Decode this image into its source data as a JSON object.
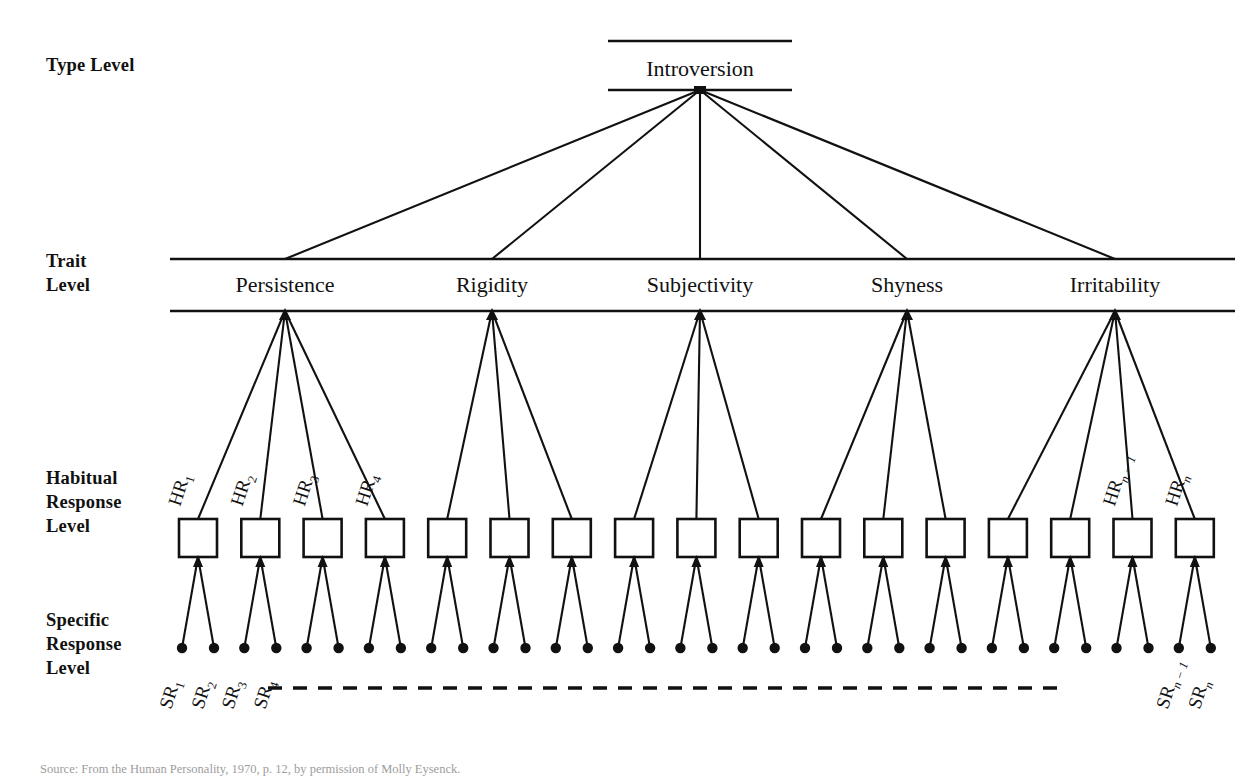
{
  "figure": {
    "source_caption": "Source: From the Human Personality, 1970, p. 12, by permission of Molly Eysenck."
  },
  "levels": [
    {
      "id": "type",
      "label": "Type Level"
    },
    {
      "id": "trait",
      "label": "Trait\nLevel"
    },
    {
      "id": "habitual",
      "label": "Habitual\nResponse\nLevel"
    },
    {
      "id": "specific",
      "label": "Specific\nResponse\nLevel"
    }
  ],
  "type_node": {
    "label": "Introversion",
    "x": 700,
    "y": 68,
    "band_left": 608,
    "band_right": 792,
    "band_top": 41,
    "band_bottom": 90
  },
  "trait_band": {
    "left": 170,
    "right": 1235,
    "top": 259,
    "bottom": 311,
    "text_y": 292
  },
  "traits": [
    {
      "label": "Persistence",
      "x": 285,
      "hr_count": 4
    },
    {
      "label": "Rigidity",
      "x": 492,
      "hr_count": 3
    },
    {
      "label": "Subjectivity",
      "x": 700,
      "hr_count": 3
    },
    {
      "label": "Shyness",
      "x": 907,
      "hr_count": 3
    },
    {
      "label": "Irritability",
      "x": 1115,
      "hr_count": 4
    }
  ],
  "hr_row": {
    "box_width": 38,
    "box_height": 38,
    "box_top": 519,
    "first_center_x": 198,
    "spacing": 62.3,
    "count": 17
  },
  "hr_labels": [
    {
      "index": 0,
      "base": "HR",
      "sub": "1",
      "sub_italic": false
    },
    {
      "index": 1,
      "base": "HR",
      "sub": "2",
      "sub_italic": false
    },
    {
      "index": 2,
      "base": "HR",
      "sub": "3",
      "sub_italic": false
    },
    {
      "index": 3,
      "base": "HR",
      "sub": "4",
      "sub_italic": false
    },
    {
      "index": 15,
      "base": "HR",
      "sub": "n − 1",
      "sub_italic": true
    },
    {
      "index": 16,
      "base": "HR",
      "sub": "n",
      "sub_italic": true
    }
  ],
  "sr_row": {
    "dot_radius": 5.2,
    "dot_y": 648,
    "leg_spread": 16,
    "per_box": 2
  },
  "sr_labels": [
    {
      "dot_index": 0,
      "base": "SR",
      "sub": "1",
      "sub_italic": false
    },
    {
      "dot_index": 1,
      "base": "SR",
      "sub": "2",
      "sub_italic": false
    },
    {
      "dot_index": 2,
      "base": "SR",
      "sub": "3",
      "sub_italic": false
    },
    {
      "dot_index": 3,
      "base": "SR",
      "sub": "4",
      "sub_italic": false
    },
    {
      "dot_index": 32,
      "base": "SR",
      "sub": "n − 1",
      "sub_italic": true
    },
    {
      "dot_index": 33,
      "base": "SR",
      "sub": "n",
      "sub_italic": true
    }
  ],
  "ellipsis_rule": {
    "y": 688,
    "left": 268,
    "right": 1065
  },
  "colors": {
    "ink": "#111111",
    "paper": "#ffffff",
    "caption": "#4a4a4a"
  }
}
